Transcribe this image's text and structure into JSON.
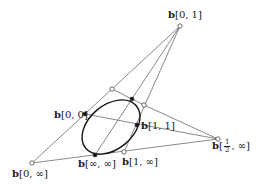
{
  "diagram": {
    "type": "conic-construction",
    "colors": {
      "line": "#555555",
      "curve": "#111111",
      "point_fill": "#111111",
      "open_point_fill": "#ffffff"
    },
    "points": {
      "b01": {
        "x": 180,
        "y": 26,
        "label_prefix": "b",
        "label_suffix": "[0, 1]",
        "style": "open"
      },
      "b0inf": {
        "x": 32,
        "y": 163,
        "label_prefix": "b",
        "label_suffix": "[0, ∞]",
        "style": "open"
      },
      "bhalfinf": {
        "x": 218,
        "y": 139,
        "label_prefix": "b",
        "label_frac_num": "1",
        "label_frac_den": "2",
        "label_tail": ", ∞]",
        "style": "open"
      },
      "b00": {
        "x": 85,
        "y": 114,
        "label_prefix": "b",
        "label_suffix": "[0, 0]",
        "style": "filled"
      },
      "b11": {
        "x": 137,
        "y": 125,
        "label_prefix": "b",
        "label_suffix": "[1, 1]",
        "style": "filled"
      },
      "binfinf": {
        "x": 95,
        "y": 155,
        "label_prefix": "b",
        "label_suffix": "[∞, ∞]",
        "style": "filled"
      },
      "b1inf": {
        "x": 124,
        "y": 152,
        "label_prefix": "b",
        "label_suffix": "[1, ∞]",
        "style": "open"
      },
      "top_tangent": {
        "x": 132,
        "y": 99,
        "style": "filled"
      },
      "open_a": {
        "x": 112,
        "y": 89,
        "style": "open"
      },
      "open_b": {
        "x": 144,
        "y": 105,
        "style": "open"
      }
    }
  }
}
